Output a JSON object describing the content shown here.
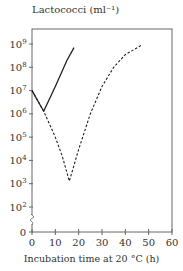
{
  "chart_data": {
    "type": "line",
    "title": "",
    "ylabel": "Lactococci (ml⁻¹)",
    "xlabel": "Incubation time at 20 °C (h)",
    "yscale": "log",
    "xlim": [
      0,
      60
    ],
    "ylim": [
      0,
      1000000000
    ],
    "grid": false,
    "legend": null,
    "x_ticks": [
      0,
      10,
      20,
      30,
      40,
      50,
      60
    ],
    "y_ticks": [
      "0",
      "10²",
      "10³",
      "10⁴",
      "10⁵",
      "10⁶",
      "10⁷",
      "10⁸",
      "10⁹"
    ],
    "y_axis_break": true,
    "series": [
      {
        "name": "solid",
        "style": "solid",
        "points": [
          {
            "x": 0,
            "y": 10000000
          },
          {
            "x": 5,
            "y": 1300000
          },
          {
            "x": 10,
            "y": 15000000
          },
          {
            "x": 15,
            "y": 200000000
          },
          {
            "x": 18,
            "y": 700000000
          }
        ]
      },
      {
        "name": "dashed",
        "style": "dashed",
        "points": [
          {
            "x": 0,
            "y": 10000000
          },
          {
            "x": 5,
            "y": 1300000
          },
          {
            "x": 10,
            "y": 100000
          },
          {
            "x": 13,
            "y": 15000
          },
          {
            "x": 16,
            "y": 1300
          },
          {
            "x": 20,
            "y": 30000
          },
          {
            "x": 25,
            "y": 1000000
          },
          {
            "x": 30,
            "y": 15000000
          },
          {
            "x": 35,
            "y": 100000000
          },
          {
            "x": 40,
            "y": 350000000
          },
          {
            "x": 47,
            "y": 900000000
          }
        ]
      }
    ]
  }
}
